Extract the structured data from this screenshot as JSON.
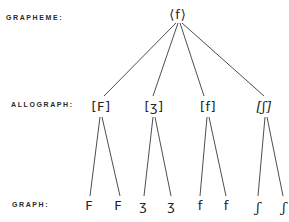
{
  "labels": {
    "grapheme": "GRAPHEME:",
    "allograph": "ALLOGRAPH:",
    "graph": "GRAPH:"
  },
  "grapheme": {
    "text": "⟨f⟩",
    "x": 178,
    "y": 14
  },
  "allographs": [
    {
      "text": "[F]",
      "x": 101,
      "y": 104
    },
    {
      "text": "[ʒ]",
      "x": 154,
      "y": 104
    },
    {
      "text": "[f]",
      "x": 208,
      "y": 104
    },
    {
      "text": "[ʃ]",
      "x": 264,
      "y": 104
    }
  ],
  "graphs": [
    {
      "text": "F",
      "x": 89,
      "y": 209,
      "parent": 0
    },
    {
      "text": "F",
      "x": 118,
      "y": 209,
      "parent": 0
    },
    {
      "text": "ʒ",
      "x": 143,
      "y": 209,
      "parent": 1
    },
    {
      "text": "ʒ",
      "x": 171,
      "y": 209,
      "parent": 1
    },
    {
      "text": "f",
      "x": 200,
      "y": 209,
      "parent": 2
    },
    {
      "text": "f",
      "x": 226,
      "y": 209,
      "parent": 2
    },
    {
      "text": "ʃ",
      "x": 258,
      "y": 209,
      "parent": 3
    },
    {
      "text": "ʃ",
      "x": 284,
      "y": 209,
      "parent": 3
    }
  ],
  "colors": {
    "ink": "#222222",
    "background": "#ffffff"
  }
}
